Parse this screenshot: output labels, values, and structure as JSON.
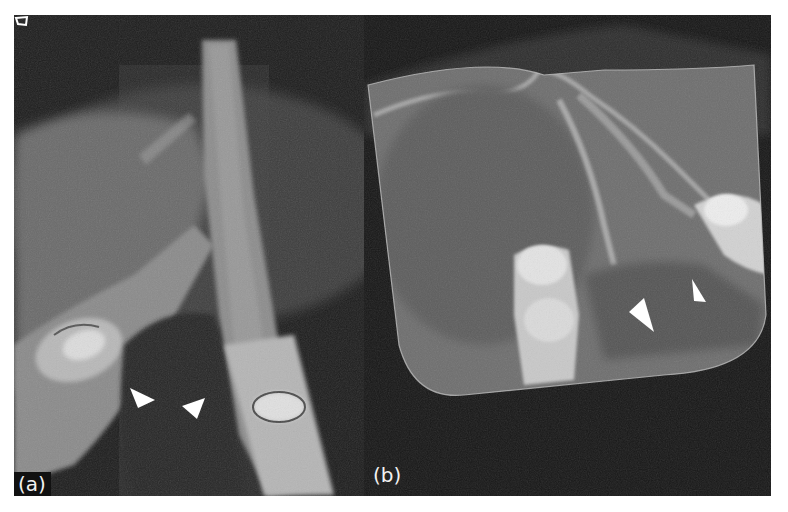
{
  "figure": {
    "panels": [
      {
        "id": "a",
        "label": "(a)",
        "description": "CBCT cross-section of mandibular anterior region, two teeth diverging with radiolucent area between roots",
        "arrowheads": 2,
        "orientation_icon": "orientation-marker-icon"
      },
      {
        "id": "b",
        "label": "(b)",
        "description": "CBCT panoramic-reconstruction view with rounded field-of-view boundary, teeth and radiolucent area",
        "arrowheads": 2
      }
    ],
    "colors": {
      "background": "#ffffff",
      "image_dark": "#1a1a1a",
      "bone_gray": "#8a8a8a",
      "tooth_light": "#d9d9d9",
      "arrowhead": "#ffffff",
      "label_text": "#f2f2f2"
    }
  }
}
